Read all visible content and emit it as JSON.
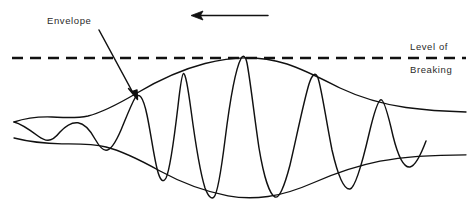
{
  "figure": {
    "background_color": "#ffffff",
    "ink_color": "#111111",
    "width": 470,
    "height": 205
  },
  "annotations": {
    "envelope_label": "Envelope",
    "level_of_label": "Level of",
    "breaking_label": "Breaking"
  },
  "icons": {
    "propagation_arrow": "arrow-left-icon",
    "envelope_pointer": "arrow-pointer-icon"
  },
  "chart_data": {
    "type": "line",
    "xlabel": "",
    "ylabel": "",
    "grid": false,
    "legend": "none",
    "xlim": [
      0,
      470
    ],
    "ylim": [
      205,
      0
    ],
    "annotations": [
      {
        "text": "Envelope",
        "x": 47,
        "y": 22,
        "pointer_from": [
          100,
          30
        ],
        "pointer_to": [
          137,
          96
        ]
      },
      {
        "text": "Level of",
        "x": 410,
        "y": 48
      },
      {
        "text": "Breaking",
        "x": 410,
        "y": 71
      }
    ],
    "reference_lines": [
      {
        "name": "level-of-breaking",
        "orientation": "horizontal",
        "y": 58,
        "x_start": 12,
        "x_end": 466,
        "style": "dashed",
        "dash_pattern": "11 7"
      }
    ],
    "direction_arrow": {
      "name": "propagation-direction",
      "from": [
        268,
        15
      ],
      "to": [
        192,
        15
      ],
      "points": "left"
    },
    "series": [
      {
        "name": "upper-envelope",
        "style": "solid",
        "points": [
          [
            14,
            122
          ],
          [
            30,
            118
          ],
          [
            48,
            117
          ],
          [
            66,
            118
          ],
          [
            86,
            117
          ],
          [
            110,
            107
          ],
          [
            135,
            95
          ],
          [
            160,
            83
          ],
          [
            182,
            73
          ],
          [
            205,
            65
          ],
          [
            225,
            60
          ],
          [
            243,
            58
          ],
          [
            262,
            58
          ],
          [
            285,
            62
          ],
          [
            310,
            72
          ],
          [
            335,
            84
          ],
          [
            360,
            94
          ],
          [
            385,
            102
          ],
          [
            410,
            107
          ],
          [
            440,
            110
          ],
          [
            466,
            112
          ]
        ]
      },
      {
        "name": "lower-envelope",
        "style": "solid",
        "points": [
          [
            14,
            138
          ],
          [
            36,
            142
          ],
          [
            60,
            144
          ],
          [
            82,
            143
          ],
          [
            105,
            147
          ],
          [
            130,
            157
          ],
          [
            155,
            169
          ],
          [
            180,
            180
          ],
          [
            205,
            190
          ],
          [
            228,
            196
          ],
          [
            248,
            198
          ],
          [
            268,
            197
          ],
          [
            290,
            192
          ],
          [
            312,
            184
          ],
          [
            335,
            175
          ],
          [
            358,
            167
          ],
          [
            382,
            161
          ],
          [
            408,
            157
          ],
          [
            436,
            155
          ],
          [
            466,
            155
          ]
        ]
      },
      {
        "name": "carrier-wave",
        "style": "solid",
        "description": "Oscillatory wave whose amplitude is bounded by the two envelope curves",
        "crests_x": [
          78,
          134,
          182,
          243,
          313,
          380
        ],
        "troughs_x": [
          48,
          106,
          157,
          213,
          278,
          347,
          413
        ],
        "crests_y": [
          124,
          97,
          73,
          58,
          72,
          100
        ],
        "troughs_y": [
          140,
          150,
          171,
          197,
          193,
          172,
          156
        ]
      }
    ]
  }
}
